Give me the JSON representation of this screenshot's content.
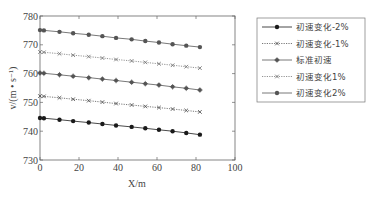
{
  "chart_data": {
    "type": "line",
    "title": "",
    "xlabel": "X/m",
    "ylabel": "v/(m·s⁻¹)",
    "xlim": [
      0,
      100
    ],
    "ylim": [
      730,
      780
    ],
    "xticks": [
      0,
      20,
      40,
      60,
      80,
      100
    ],
    "yticks": [
      730,
      740,
      750,
      760,
      770,
      780
    ],
    "grid": false,
    "legend_position": "right-outside",
    "x": [
      0,
      2,
      10,
      17,
      25,
      32,
      39,
      47,
      54,
      61,
      68,
      75,
      82
    ],
    "series": [
      {
        "name": "初速变化-2%",
        "style": "solid",
        "marker": "filled-circle",
        "color": "#1a1a1a",
        "values": [
          744.6,
          744.5,
          744.0,
          743.5,
          743.0,
          742.5,
          742.0,
          741.5,
          741.0,
          740.5,
          740.0,
          739.4,
          738.8
        ]
      },
      {
        "name": "初速变化-1%",
        "style": "dotted",
        "marker": "x",
        "color": "#555555",
        "values": [
          752.2,
          752.1,
          751.6,
          751.1,
          750.6,
          750.1,
          749.6,
          749.1,
          748.6,
          748.2,
          747.7,
          747.2,
          746.7
        ]
      },
      {
        "name": "标准初速",
        "style": "solid",
        "marker": "star",
        "color": "#555555",
        "values": [
          760.2,
          760.1,
          759.6,
          759.1,
          758.6,
          758.1,
          757.6,
          757.0,
          756.5,
          756.0,
          755.4,
          754.9,
          754.3
        ]
      },
      {
        "name": "初速变化1%",
        "style": "dotted",
        "marker": "x",
        "color": "#777777",
        "values": [
          767.5,
          767.4,
          766.9,
          766.4,
          765.9,
          765.4,
          764.9,
          764.4,
          763.9,
          763.4,
          762.9,
          762.4,
          761.9
        ]
      },
      {
        "name": "初速变化2%",
        "style": "solid",
        "marker": "filled-circle",
        "color": "#555555",
        "values": [
          775.1,
          775.0,
          774.5,
          774.0,
          773.5,
          773.0,
          772.4,
          771.9,
          771.3,
          770.8,
          770.2,
          769.7,
          769.2
        ]
      }
    ]
  },
  "labels": {
    "xlabel": "X/m",
    "ylabel": "v/(m • s⁻¹)"
  }
}
